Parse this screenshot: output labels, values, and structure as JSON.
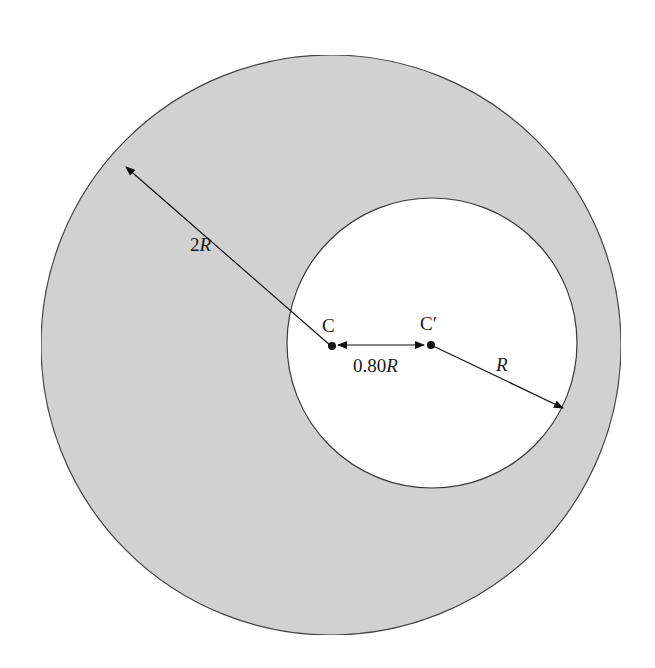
{
  "diagram": {
    "colors": {
      "fill": "#d2d2d2",
      "outline": "#3a3a3a",
      "hole": "#ffffff",
      "ink": "#111111"
    },
    "outer_circle": {
      "cx": 331,
      "cy": 345,
      "r": 290,
      "label_prefix": "2",
      "label_var": "R"
    },
    "inner_circle": {
      "cx": 432,
      "cy": 345,
      "r": 145,
      "label_var": "R"
    },
    "points": {
      "C": {
        "label": "C",
        "x": 331,
        "y": 346
      },
      "C_prime": {
        "label": "C′",
        "x": 431,
        "y": 345
      }
    },
    "offset": {
      "label_num": "0.80",
      "label_var": "R"
    },
    "labels": {
      "outer_radius": "2R",
      "inner_radius": "R",
      "center_outer": "C",
      "center_inner": "C′",
      "separation": "0.80R"
    }
  }
}
